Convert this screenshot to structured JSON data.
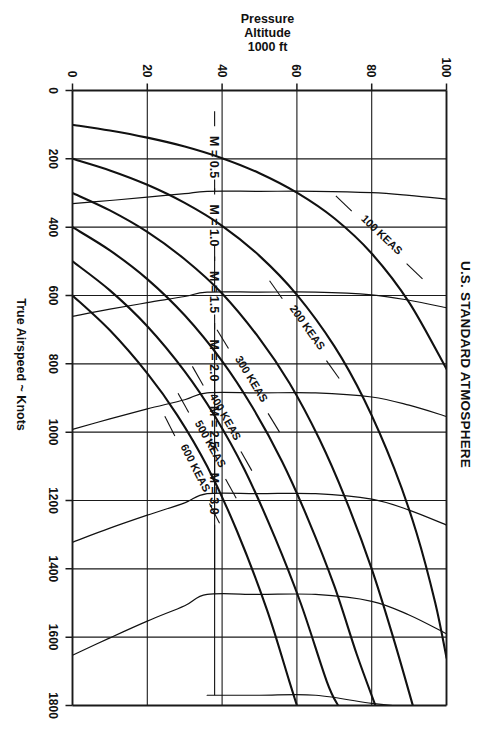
{
  "page": {
    "background_color": "#ffffff",
    "ink_color": "#111111",
    "rotation_note_deg": 90
  },
  "chart_data": {
    "type": "line",
    "title": "U.S. STANDARD ATMOSPHERE",
    "xlabel": "True Airspeed ~ Knots",
    "ylabel": "Pressure Altitude 1000 ft",
    "ylabel_lines": [
      "Pressure",
      "Altitude",
      "1000 ft"
    ],
    "xlim": [
      0,
      1800
    ],
    "ylim": [
      0,
      100
    ],
    "xticks": [
      0,
      200,
      400,
      600,
      800,
      1000,
      1200,
      1400,
      1600,
      1800
    ],
    "xtick_labels": [
      "0",
      "200",
      "400",
      "600",
      "800",
      "1000",
      "1200",
      "1400",
      "1600",
      "1800"
    ],
    "yticks": [
      0,
      20,
      40,
      60,
      80,
      100
    ],
    "ytick_labels": [
      "0",
      "20",
      "40",
      "60",
      "80",
      "100"
    ],
    "grid": true,
    "grid_style": "rectangular rulings at every labelled tick on both axes",
    "legend": "none - curves are labelled in place",
    "series": [
      {
        "name": "100 KEAS",
        "label": "100 KEAS",
        "kind": "keas",
        "label_at": {
          "x": 430,
          "y": 82
        },
        "points": [
          {
            "alt": 0,
            "tas": 100
          },
          {
            "alt": 10,
            "tas": 117
          },
          {
            "alt": 20,
            "tas": 138
          },
          {
            "alt": 30,
            "tas": 164
          },
          {
            "alt": 40,
            "tas": 198
          },
          {
            "alt": 50,
            "tas": 242
          },
          {
            "alt": 60,
            "tas": 299
          },
          {
            "alt": 70,
            "tas": 374
          },
          {
            "alt": 80,
            "tas": 477
          },
          {
            "alt": 90,
            "tas": 620
          },
          {
            "alt": 100,
            "tas": 815
          }
        ]
      },
      {
        "name": "200 KEAS",
        "label": "200 KEAS",
        "kind": "keas",
        "label_at": {
          "x": 700,
          "y": 62
        },
        "points": [
          {
            "alt": 0,
            "tas": 200
          },
          {
            "alt": 10,
            "tas": 234
          },
          {
            "alt": 20,
            "tas": 276
          },
          {
            "alt": 30,
            "tas": 329
          },
          {
            "alt": 40,
            "tas": 396
          },
          {
            "alt": 50,
            "tas": 484
          },
          {
            "alt": 60,
            "tas": 598
          },
          {
            "alt": 70,
            "tas": 748
          },
          {
            "alt": 78,
            "tas": 905
          },
          {
            "alt": 86,
            "tas": 1105
          },
          {
            "alt": 92,
            "tas": 1295
          },
          {
            "alt": 97,
            "tas": 1500
          },
          {
            "alt": 100,
            "tas": 1660
          }
        ]
      },
      {
        "name": "300 KEAS",
        "label": "300 KEAS",
        "kind": "keas",
        "label_at": {
          "x": 850,
          "y": 47
        },
        "points": [
          {
            "alt": 0,
            "tas": 300
          },
          {
            "alt": 10,
            "tas": 351
          },
          {
            "alt": 20,
            "tas": 414
          },
          {
            "alt": 30,
            "tas": 494
          },
          {
            "alt": 40,
            "tas": 594
          },
          {
            "alt": 50,
            "tas": 726
          },
          {
            "alt": 58,
            "tas": 856
          },
          {
            "alt": 66,
            "tas": 1020
          },
          {
            "alt": 73,
            "tas": 1195
          },
          {
            "alt": 80,
            "tas": 1400
          },
          {
            "alt": 86,
            "tas": 1610
          },
          {
            "alt": 91,
            "tas": 1800
          }
        ]
      },
      {
        "name": "400 KEAS",
        "label": "400 KEAS",
        "kind": "keas",
        "label_at": {
          "x": 960,
          "y": 40
        },
        "points": [
          {
            "alt": 0,
            "tas": 400
          },
          {
            "alt": 10,
            "tas": 468
          },
          {
            "alt": 20,
            "tas": 552
          },
          {
            "alt": 30,
            "tas": 658
          },
          {
            "alt": 40,
            "tas": 792
          },
          {
            "alt": 48,
            "tas": 925
          },
          {
            "alt": 56,
            "tas": 1085
          },
          {
            "alt": 63,
            "tas": 1255
          },
          {
            "alt": 70,
            "tas": 1450
          },
          {
            "alt": 76,
            "tas": 1650
          },
          {
            "alt": 81,
            "tas": 1800
          }
        ]
      },
      {
        "name": "500 KEAS",
        "label": "500 KEAS",
        "kind": "keas",
        "label_at": {
          "x": 1040,
          "y": 36
        },
        "points": [
          {
            "alt": 0,
            "tas": 500
          },
          {
            "alt": 10,
            "tas": 585
          },
          {
            "alt": 20,
            "tas": 690
          },
          {
            "alt": 30,
            "tas": 822
          },
          {
            "alt": 38,
            "tas": 952
          },
          {
            "alt": 46,
            "tas": 1110
          },
          {
            "alt": 54,
            "tas": 1305
          },
          {
            "alt": 61,
            "tas": 1500
          },
          {
            "alt": 68,
            "tas": 1730
          },
          {
            "alt": 71,
            "tas": 1800
          }
        ]
      },
      {
        "name": "600 KEAS",
        "label": "600 KEAS",
        "kind": "keas",
        "label_at": {
          "x": 1110,
          "y": 32
        },
        "points": [
          {
            "alt": 0,
            "tas": 600
          },
          {
            "alt": 10,
            "tas": 702
          },
          {
            "alt": 20,
            "tas": 828
          },
          {
            "alt": 28,
            "tas": 950
          },
          {
            "alt": 36,
            "tas": 1100
          },
          {
            "alt": 44,
            "tas": 1290
          },
          {
            "alt": 52,
            "tas": 1520
          },
          {
            "alt": 58,
            "tas": 1730
          },
          {
            "alt": 60,
            "tas": 1800
          }
        ]
      },
      {
        "name": "M = 0.5",
        "label": "M = 0.5",
        "kind": "mach",
        "mach": 0.5,
        "label_at": {
          "x": 195,
          "y": 38
        },
        "points": [
          {
            "alt": 0,
            "tas": 331
          },
          {
            "alt": 10,
            "tas": 322
          },
          {
            "alt": 20,
            "tas": 312
          },
          {
            "alt": 30,
            "tas": 302
          },
          {
            "alt": 36,
            "tas": 295
          },
          {
            "alt": 50,
            "tas": 295
          },
          {
            "alt": 65,
            "tas": 295
          },
          {
            "alt": 80,
            "tas": 299
          },
          {
            "alt": 90,
            "tas": 307
          },
          {
            "alt": 100,
            "tas": 318
          }
        ]
      },
      {
        "name": "M = 1.0",
        "label": "M = 1.0",
        "kind": "mach",
        "mach": 1.0,
        "label_at": {
          "x": 395,
          "y": 38
        },
        "points": [
          {
            "alt": 0,
            "tas": 661
          },
          {
            "alt": 10,
            "tas": 640
          },
          {
            "alt": 20,
            "tas": 621
          },
          {
            "alt": 30,
            "tas": 603
          },
          {
            "alt": 36,
            "tas": 590
          },
          {
            "alt": 50,
            "tas": 590
          },
          {
            "alt": 65,
            "tas": 590
          },
          {
            "alt": 80,
            "tas": 598
          },
          {
            "alt": 90,
            "tas": 614
          },
          {
            "alt": 100,
            "tas": 636
          }
        ]
      },
      {
        "name": "M = 1.5",
        "label": "M = 1.5",
        "kind": "mach",
        "mach": 1.5,
        "label_at": {
          "x": 590,
          "y": 38
        },
        "points": [
          {
            "alt": 0,
            "tas": 992
          },
          {
            "alt": 10,
            "tas": 961
          },
          {
            "alt": 20,
            "tas": 932
          },
          {
            "alt": 30,
            "tas": 905
          },
          {
            "alt": 36,
            "tas": 885
          },
          {
            "alt": 50,
            "tas": 885
          },
          {
            "alt": 65,
            "tas": 885
          },
          {
            "alt": 80,
            "tas": 897
          },
          {
            "alt": 90,
            "tas": 921
          },
          {
            "alt": 100,
            "tas": 954
          }
        ]
      },
      {
        "name": "M = 2.0",
        "label": "M = 2.0",
        "kind": "mach",
        "mach": 2.0,
        "label_at": {
          "x": 790,
          "y": 38
        },
        "points": [
          {
            "alt": 0,
            "tas": 1322
          },
          {
            "alt": 10,
            "tas": 1281
          },
          {
            "alt": 20,
            "tas": 1243
          },
          {
            "alt": 30,
            "tas": 1207
          },
          {
            "alt": 36,
            "tas": 1180
          },
          {
            "alt": 50,
            "tas": 1180
          },
          {
            "alt": 65,
            "tas": 1180
          },
          {
            "alt": 80,
            "tas": 1196
          },
          {
            "alt": 90,
            "tas": 1228
          },
          {
            "alt": 100,
            "tas": 1272
          }
        ]
      },
      {
        "name": "M = 2.5",
        "label": "M = 2.5",
        "kind": "mach",
        "mach": 2.5,
        "label_at": {
          "x": 985,
          "y": 38
        },
        "points": [
          {
            "alt": 0,
            "tas": 1653
          },
          {
            "alt": 10,
            "tas": 1602
          },
          {
            "alt": 20,
            "tas": 1553
          },
          {
            "alt": 30,
            "tas": 1508
          },
          {
            "alt": 36,
            "tas": 1475
          },
          {
            "alt": 50,
            "tas": 1475
          },
          {
            "alt": 65,
            "tas": 1475
          },
          {
            "alt": 80,
            "tas": 1495
          },
          {
            "alt": 90,
            "tas": 1535
          },
          {
            "alt": 100,
            "tas": 1590
          }
        ]
      },
      {
        "name": "M = 3.0",
        "label": "M = 3.0",
        "kind": "mach",
        "mach": 3.0,
        "label_at": {
          "x": 1180,
          "y": 38
        },
        "points": [
          {
            "alt": 36,
            "tas": 1770
          },
          {
            "alt": 50,
            "tas": 1770
          },
          {
            "alt": 65,
            "tas": 1770
          },
          {
            "alt": 80,
            "tas": 1794
          },
          {
            "alt": 86,
            "tas": 1800
          }
        ]
      }
    ]
  }
}
